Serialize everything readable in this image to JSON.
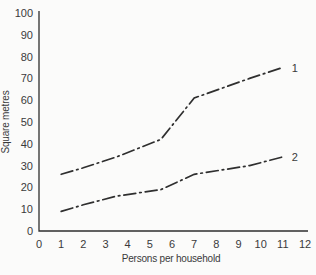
{
  "figure": {
    "background_color": "#fbfbfa",
    "line_color": "#2f2f2f",
    "text_color": "#3a3a3a"
  },
  "chart_data": {
    "type": "line",
    "title": "",
    "xlabel": "Persons per household",
    "ylabel": "Square metres",
    "xlim": [
      0,
      12
    ],
    "ylim": [
      0,
      100
    ],
    "x_ticks": [
      0,
      1,
      2,
      3,
      4,
      5,
      6,
      7,
      8,
      9,
      10,
      11,
      12
    ],
    "y_ticks": [
      0,
      10,
      20,
      30,
      40,
      50,
      60,
      70,
      80,
      90,
      100
    ],
    "grid": false,
    "line_style": "dash-dot",
    "legend_position": "end-of-line-labels",
    "series": [
      {
        "name": "1",
        "label": "1",
        "x": [
          1,
          2,
          3.5,
          5.5,
          7,
          9.5,
          11
        ],
        "y": [
          26,
          29,
          34,
          42,
          61,
          70,
          75
        ]
      },
      {
        "name": "2",
        "label": "2",
        "x": [
          1,
          2,
          3.5,
          5.5,
          7,
          9.5,
          11
        ],
        "y": [
          9,
          12,
          16,
          19,
          26,
          30,
          34
        ]
      }
    ]
  }
}
